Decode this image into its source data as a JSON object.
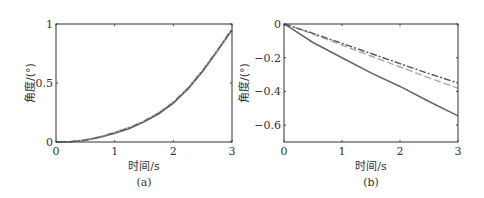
{
  "chart_data": [
    {
      "type": "line",
      "panel_label": "(a)",
      "xlabel": "时间/s",
      "ylabel": "角度/(°)",
      "xlim": [
        0,
        3
      ],
      "ylim": [
        0,
        1
      ],
      "xticks": [
        "0",
        "1",
        "2",
        "3"
      ],
      "yticks": [
        "0",
        "0.5",
        "1"
      ],
      "grid": false,
      "legend": null,
      "x": [
        0,
        0.25,
        0.5,
        0.75,
        1.0,
        1.25,
        1.5,
        1.75,
        2.0,
        2.25,
        2.5,
        2.75,
        3.0
      ],
      "series": [
        {
          "name": "solid",
          "style": "solid",
          "color": "#555555",
          "values": [
            0,
            0.002,
            0.015,
            0.04,
            0.075,
            0.115,
            0.17,
            0.24,
            0.33,
            0.45,
            0.6,
            0.77,
            0.95
          ]
        },
        {
          "name": "dashed",
          "style": "dashed",
          "color": "#aaaaaa",
          "values": [
            0,
            0.003,
            0.018,
            0.045,
            0.082,
            0.125,
            0.18,
            0.25,
            0.34,
            0.46,
            0.61,
            0.78,
            0.96
          ]
        },
        {
          "name": "dash-dot",
          "style": "dashdot",
          "color": "#666666",
          "values": [
            0,
            0.003,
            0.017,
            0.043,
            0.08,
            0.12,
            0.175,
            0.245,
            0.335,
            0.455,
            0.605,
            0.775,
            0.955
          ]
        }
      ]
    },
    {
      "type": "line",
      "panel_label": "(b)",
      "xlabel": "时间/s",
      "ylabel": "角度/(°)",
      "xlim": [
        0,
        3
      ],
      "ylim": [
        -0.7,
        0
      ],
      "xticks": [
        "0",
        "1",
        "2",
        "3"
      ],
      "yticks": [
        "0",
        "−0.2",
        "−0.4",
        "−0.6"
      ],
      "grid": false,
      "legend": null,
      "x": [
        0,
        0.1,
        0.5,
        1.0,
        1.5,
        2.0,
        2.5,
        3.0
      ],
      "series": [
        {
          "name": "solid",
          "style": "solid",
          "color": "#666666",
          "values": [
            0,
            -0.02,
            -0.11,
            -0.2,
            -0.29,
            -0.37,
            -0.46,
            -0.545
          ]
        },
        {
          "name": "dashed",
          "style": "dashed",
          "color": "#aaaaaa",
          "values": [
            0,
            -0.01,
            -0.06,
            -0.125,
            -0.19,
            -0.255,
            -0.32,
            -0.38
          ]
        },
        {
          "name": "dash-dot",
          "style": "dashdot",
          "color": "#555555",
          "values": [
            0,
            -0.01,
            -0.055,
            -0.115,
            -0.175,
            -0.235,
            -0.295,
            -0.35
          ]
        }
      ]
    }
  ]
}
